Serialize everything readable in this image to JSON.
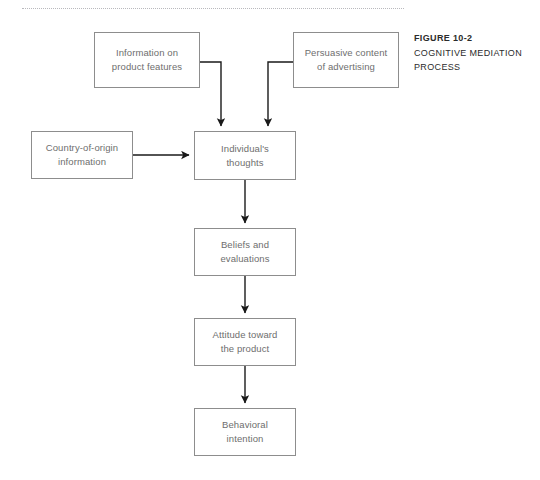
{
  "figure": {
    "caption_title": "FIGURE 10-2",
    "caption_line_1": "COGNITIVE MEDIATION",
    "caption_line_2": "PROCESS",
    "rule": "dotted-divider"
  },
  "colors": {
    "box_border": "#8d8d8d",
    "box_text": "#6e6e6e",
    "connector": "#1a1a1a",
    "caption_text": "#2b2b2b",
    "divider": "#b9b9bd",
    "background": "#ffffff"
  },
  "diagram": {
    "type": "flowchart",
    "nodes": [
      {
        "id": "info_product",
        "label": "Information on\nproduct features"
      },
      {
        "id": "persuasive",
        "label": "Persuasive content\nof advertising"
      },
      {
        "id": "country",
        "label": "Country-of-origin\ninformation"
      },
      {
        "id": "thoughts",
        "label": "Individual's\nthoughts"
      },
      {
        "id": "beliefs",
        "label": "Beliefs and\nevaluations"
      },
      {
        "id": "attitude",
        "label": "Attitude toward\nthe product"
      },
      {
        "id": "behavioral",
        "label": "Behavioral\nintention"
      }
    ],
    "edges": [
      {
        "from": "info_product",
        "to": "thoughts",
        "style": "elbow-right-down"
      },
      {
        "from": "persuasive",
        "to": "thoughts",
        "style": "elbow-left-down"
      },
      {
        "from": "country",
        "to": "thoughts",
        "style": "straight-right"
      },
      {
        "from": "thoughts",
        "to": "beliefs",
        "style": "straight-down"
      },
      {
        "from": "beliefs",
        "to": "attitude",
        "style": "straight-down"
      },
      {
        "from": "attitude",
        "to": "behavioral",
        "style": "straight-down"
      }
    ]
  }
}
